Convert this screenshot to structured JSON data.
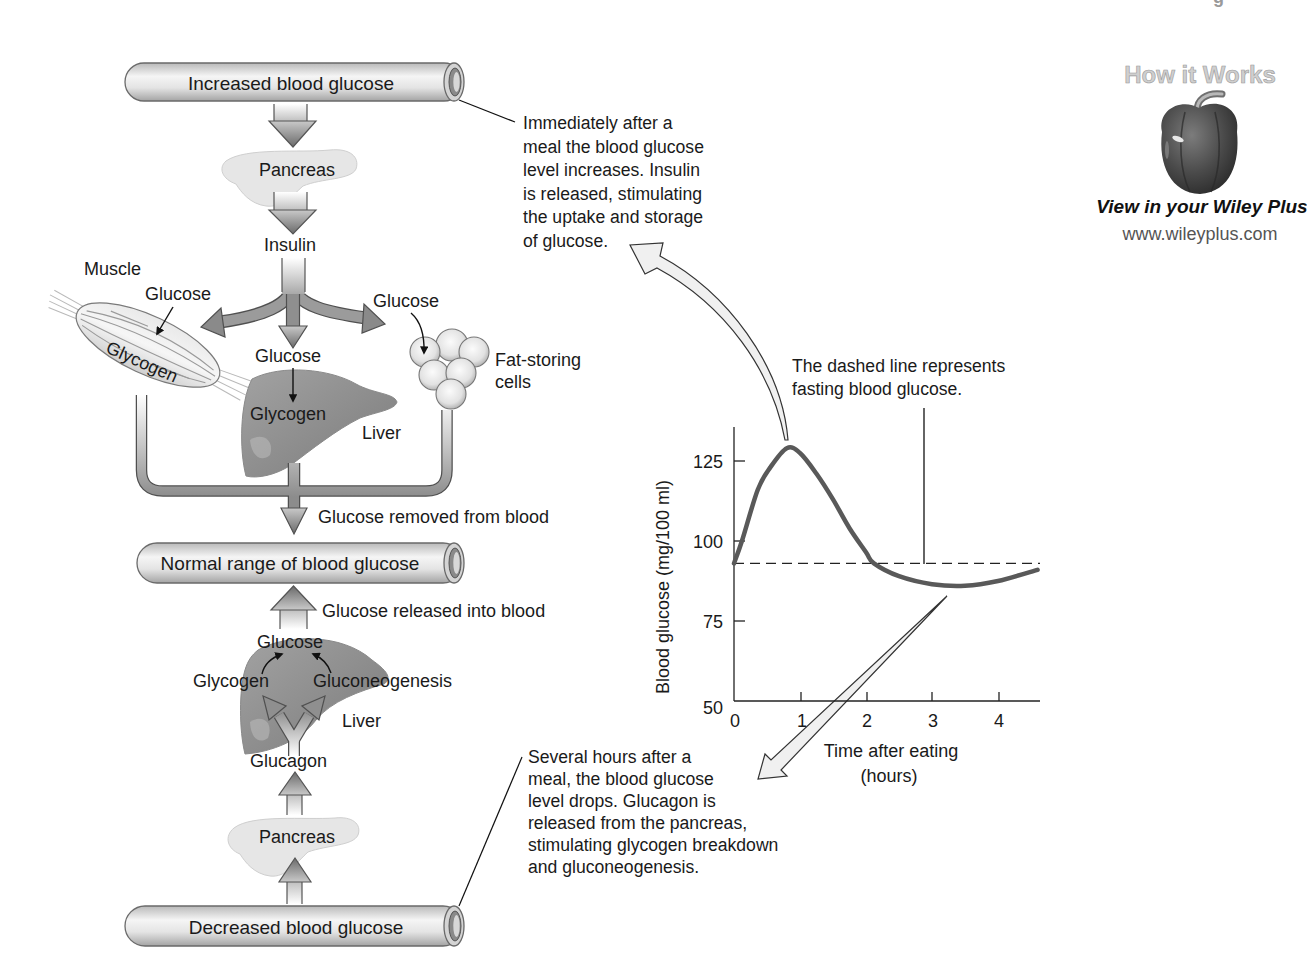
{
  "page_header_fragment": "g",
  "tubes": {
    "increased": "Increased blood glucose",
    "normal": "Normal range of blood glucose",
    "decreased": "Decreased blood glucose"
  },
  "upper_pathway": {
    "pancreas": "Pancreas",
    "hormone": "Insulin",
    "muscle": "Muscle",
    "muscle_glucose": "Glucose",
    "muscle_glycogen": "Glycogen",
    "liver_glucose": "Glucose",
    "liver_glycogen": "Glycogen",
    "liver": "Liver",
    "fat_glucose": "Glucose",
    "fat_cells": [
      "Fat-storing",
      "cells"
    ],
    "result": "Glucose removed from blood"
  },
  "lower_pathway": {
    "result": "Glucose released into blood",
    "glucose": "Glucose",
    "glycogen": "Glycogen",
    "gluconeogenesis": "Gluconeogenesis",
    "liver": "Liver",
    "hormone": "Glucagon",
    "pancreas": "Pancreas"
  },
  "annotations": {
    "after_meal": [
      "Immediately after a",
      "meal the blood glucose",
      "level increases. Insulin",
      "is released, stimulating",
      "the uptake and storage",
      "of glucose."
    ],
    "hours_after_meal": [
      "Several hours after a",
      "meal, the blood glucose",
      "level drops. Glucagon is",
      "released from the pancreas,",
      "stimulating glycogen breakdown",
      "and gluconeogenesis."
    ],
    "dashed_line_note": [
      "The dashed line represents",
      "fasting blood glucose."
    ]
  },
  "chart_data": {
    "type": "line",
    "title": "",
    "xlabel": "Time after eating (hours)",
    "xlabel_lines": [
      "Time after eating",
      "(hours)"
    ],
    "ylabel": "Blood glucose (mg/100 ml)",
    "x": [
      0,
      0.12,
      0.36,
      0.55,
      0.8,
      1.0,
      1.25,
      1.5,
      1.75,
      2.0,
      2.12,
      2.5,
      3.0,
      3.5,
      4.0,
      4.6
    ],
    "series": [
      {
        "name": "Blood glucose",
        "values": [
          93,
          100,
          116,
          123,
          129,
          127.5,
          121,
          113,
          104,
          96.5,
          93,
          89,
          86.5,
          86,
          87.5,
          91
        ]
      }
    ],
    "reference_line": {
      "name": "Fasting blood glucose (dashed)",
      "value": 93
    },
    "xticks": [
      "0",
      "1",
      "2",
      "3",
      "4"
    ],
    "yticks": [
      "50",
      "75",
      "100",
      "125"
    ],
    "xlim": [
      0,
      4.6
    ],
    "ylim": [
      50,
      135
    ],
    "grid": false,
    "legend": "none"
  },
  "wiley": {
    "title": "How it Works",
    "icon": "bell-pepper-icon",
    "cta": "View in your Wiley Plus",
    "url": "www.wileyplus.com"
  },
  "caption_fragment": "Figure 4.23",
  "colors": {
    "curve": "#595959",
    "arrow_fill": "#8f8f8f",
    "outline": "#505050",
    "text": "#1a1a1a"
  }
}
